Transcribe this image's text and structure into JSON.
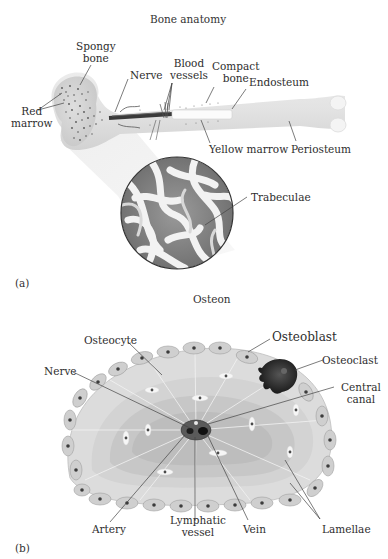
{
  "panel_a": {
    "title": "Bone anatomy",
    "tag": "(a)",
    "labels": {
      "spongy_bone_1": "Spongy",
      "spongy_bone_2": "bone",
      "nerve": "Nerve",
      "blood_vessels_1": "Blood",
      "blood_vessels_2": "vessels",
      "compact_bone_1": "Compact",
      "compact_bone_2": "bone",
      "endosteum": "Endosteum",
      "red_marrow_1": "Red",
      "red_marrow_2": "marrow",
      "yellow_marrow": "Yellow marrow",
      "periosteum": "Periosteum",
      "trabeculae": "Trabeculae"
    }
  },
  "panel_b": {
    "title": "Osteon",
    "tag": "(b)",
    "labels": {
      "osteocyte": "Osteocyte",
      "osteoblast": "Osteoblast",
      "osteoclast": "Osteoclast",
      "nerve": "Nerve",
      "central_canal_1": "Central",
      "central_canal_2": "canal",
      "artery": "Artery",
      "lymphatic_vessel_1": "Lymphatic",
      "lymphatic_vessel_2": "vessel",
      "vein": "Vein",
      "lamellae": "Lamellae"
    }
  },
  "colors": {
    "bone_fill": "#e6e6e6",
    "bone_shadow": "#cfcfcf",
    "marrow_dots": "#555555",
    "nerve_dark": "#3a3a3a",
    "yellow_marrow": "#fafafa",
    "osteoclast": "#222222",
    "lamella_light": "#d9d9d9",
    "lamella_dark": "#c4c4c4",
    "cell_fill": "#cdcdcd",
    "nucleus": "#3c3c3c",
    "leader_line": "#444444"
  }
}
